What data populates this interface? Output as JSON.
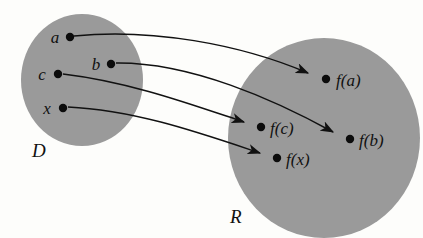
{
  "figure": {
    "kind": "function-mapping-diagram",
    "background_color": "#fdfdfb",
    "set_fill_color": "#9a9a9a",
    "stroke_color": "#111111"
  },
  "domain_set": {
    "label": "D",
    "label_x": 40,
    "label_y": 155,
    "cx": 82,
    "cy": 80,
    "rx": 61,
    "ry": 66,
    "elements": [
      {
        "label": "a",
        "label_x": 55,
        "label_y": 43,
        "dot_x": 70,
        "dot_y": 37
      },
      {
        "label": "b",
        "label_x": 95,
        "label_y": 70,
        "dot_x": 111,
        "dot_y": 64
      },
      {
        "label": "c",
        "label_x": 41,
        "label_y": 80,
        "dot_x": 58,
        "dot_y": 74
      },
      {
        "label": "x",
        "label_x": 46,
        "label_y": 114,
        "dot_x": 63,
        "dot_y": 108
      }
    ]
  },
  "range_set": {
    "label": "R",
    "label_x": 234,
    "label_y": 221,
    "cx": 324,
    "cy": 138,
    "rx": 96,
    "ry": 100,
    "elements": [
      {
        "label": "f(a)",
        "label_x": 338,
        "label_y": 86,
        "dot_x": 326,
        "dot_y": 79
      },
      {
        "label": "f(c)",
        "label_x": 272,
        "label_y": 134,
        "dot_x": 261,
        "dot_y": 127
      },
      {
        "label": "f(b)",
        "label_x": 361,
        "label_y": 146,
        "dot_x": 350,
        "dot_y": 139
      },
      {
        "label": "f(x)",
        "label_x": 288,
        "label_y": 165,
        "dot_x": 277,
        "dot_y": 158
      }
    ]
  },
  "mappings": [
    {
      "name": "a-to-fa",
      "from": "a",
      "to": "f(a)",
      "path": "M 74 36 C 150 28, 240 44, 308 73"
    },
    {
      "name": "b-to-fb",
      "from": "b",
      "to": "f(b)",
      "path": "M 116 63 C 190 62, 275 100, 333 132"
    },
    {
      "name": "c-to-fc",
      "from": "c",
      "to": "f(c)",
      "path": "M 63 74 C 130 82, 190 104, 244 122"
    },
    {
      "name": "x-to-fx",
      "from": "x",
      "to": "f(x)",
      "path": "M 68 107 C 135 110, 200 133, 260 153"
    }
  ]
}
